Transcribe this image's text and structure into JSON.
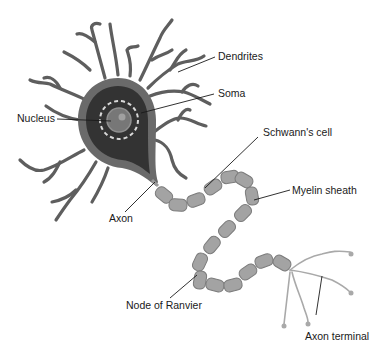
{
  "diagram": {
    "labels": {
      "dendrites": "Dendrites",
      "soma": "Soma",
      "nucleus": "Nucleus",
      "schwann_cell": "Schwann's cell",
      "myelin_sheath": "Myelin sheath",
      "axon": "Axon",
      "node_of_ranvier": "Node of Ranvier",
      "axon_terminal": "Axon terminal"
    },
    "colors": {
      "background": "#ffffff",
      "dendrite": "#5e5e5e",
      "soma_outer": "#6a6a6a",
      "soma_inner": "#333333",
      "nucleus": "#777777",
      "nucleolus": "#9a9a9a",
      "myelin": "#a3a3a3",
      "axon_terminal": "#a9a9a9",
      "label_text": "#1a1a1a"
    }
  }
}
